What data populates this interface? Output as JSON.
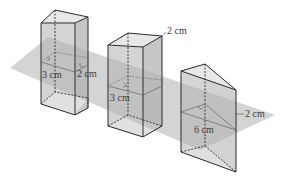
{
  "figure": {
    "colors": {
      "plane": "#b8b8b8",
      "face_front": "#d4d4d4",
      "face_side": "#c6c6c6",
      "face_top": "#e6e6e6",
      "edge": "#2b2b2b",
      "text": "#3a3a3a"
    },
    "solids": [
      {
        "name": "rectangular prism 1",
        "labels": [
          "3 cm",
          "2 cm"
        ]
      },
      {
        "name": "rectangular prism 2",
        "labels": [
          "2 cm",
          "3 cm"
        ]
      },
      {
        "name": "triangular prism",
        "labels": [
          "2 cm",
          "6 cm"
        ]
      }
    ]
  }
}
